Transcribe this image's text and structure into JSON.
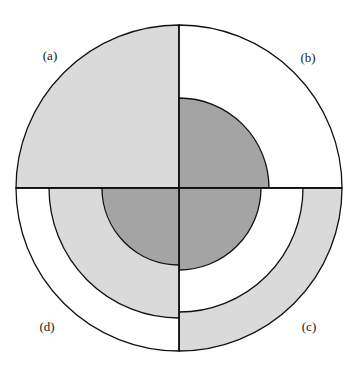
{
  "diagram": {
    "center": {
      "x": 179,
      "y": 188
    },
    "outer_radius": 163,
    "colors": {
      "white": "#ffffff",
      "light_gray": "#dadada",
      "dark_gray": "#a4a4a4",
      "stroke": "#111111"
    },
    "quadrants": [
      {
        "id": "a",
        "label": "(a)",
        "position": "top-left",
        "start_angle": 180,
        "label_pos": {
          "x": 50,
          "y": 60
        },
        "rings": [
          {
            "radius": 163,
            "fill": "light_gray"
          }
        ]
      },
      {
        "id": "b",
        "label": "(b)",
        "position": "top-right",
        "start_angle": 270,
        "label_pos": {
          "x": 308,
          "y": 62
        },
        "rings": [
          {
            "radius": 163,
            "fill": "white"
          },
          {
            "radius": 90,
            "fill": "dark_gray"
          }
        ]
      },
      {
        "id": "c",
        "label": "(c)",
        "position": "bottom-right",
        "start_angle": 0,
        "label_pos": {
          "x": 309,
          "y": 331
        },
        "rings": [
          {
            "radius": 163,
            "fill": "light_gray"
          },
          {
            "radius": 124,
            "fill": "white"
          },
          {
            "radius": 82,
            "fill": "dark_gray"
          }
        ]
      },
      {
        "id": "d",
        "label": "(d)",
        "position": "bottom-left",
        "start_angle": 90,
        "label_pos": {
          "x": 47,
          "y": 331
        },
        "rings": [
          {
            "radius": 163,
            "fill": "white"
          },
          {
            "radius": 130,
            "fill": "light_gray"
          },
          {
            "radius": 77,
            "fill": "dark_gray"
          }
        ]
      }
    ]
  }
}
